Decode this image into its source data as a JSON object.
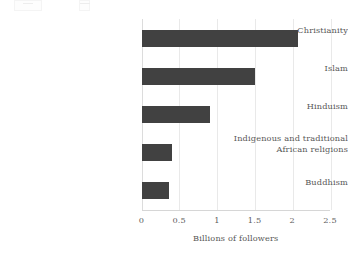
{
  "chart_data": {
    "type": "bar",
    "orientation": "horizontal",
    "title": "",
    "subtitle": "",
    "xlabel": "Billions of followers",
    "ylabel": "",
    "xlim": [
      0,
      2.5
    ],
    "grid": "vertical",
    "legend": "none",
    "categories": [
      "Christianity",
      "Islam",
      "Hinduism",
      "Indigenous and traditional African religions",
      "Buddhism"
    ],
    "values": [
      2.07,
      1.5,
      0.91,
      0.4,
      0.37
    ],
    "xticks": [
      "0",
      "0.5",
      "1",
      "1.5",
      "2",
      "2.5"
    ],
    "xtick_values": [
      0,
      0.5,
      1,
      1.5,
      2,
      2.5
    ],
    "bar_color": "#414141",
    "grid_color": "#e9e9e9",
    "text_color": "#585858",
    "background_color": "#ffffff"
  },
  "labels": {
    "christianity": "Christianity",
    "islam": "Islam",
    "hinduism": "Hinduism",
    "indigenous_line1": "Indigenous and traditional",
    "indigenous_line2": "African religions",
    "buddhism": "Buddhism"
  },
  "axis": {
    "x_title": "Billions of followers",
    "ticks": {
      "t0": "0",
      "t1": "0.5",
      "t2": "1",
      "t3": "1.5",
      "t4": "2",
      "t5": "2.5"
    }
  }
}
